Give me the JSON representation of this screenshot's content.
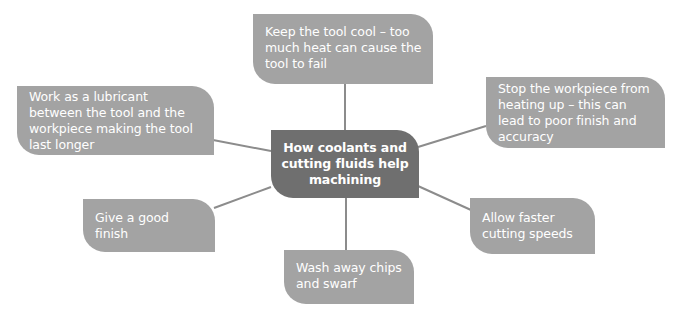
{
  "diagram": {
    "type": "mind-map",
    "center": {
      "label": "How coolants and cutting fluids help machining"
    },
    "nodes": [
      {
        "id": "top",
        "label": "Keep the tool cool – too much heat can cause the tool to fail"
      },
      {
        "id": "left",
        "label": "Work as a lubricant between the tool and the workpiece making the tool last longer"
      },
      {
        "id": "right",
        "label": "Stop the workpiece from heating up – this can lead to poor finish and accuracy"
      },
      {
        "id": "finish",
        "label": "Give a good finish"
      },
      {
        "id": "speed",
        "label": "Allow faster cutting speeds"
      },
      {
        "id": "wash",
        "label": "Wash away chips and swarf"
      }
    ],
    "edges": [
      {
        "from": "center",
        "to": "top"
      },
      {
        "from": "center",
        "to": "left"
      },
      {
        "from": "center",
        "to": "right"
      },
      {
        "from": "center",
        "to": "finish"
      },
      {
        "from": "center",
        "to": "speed"
      },
      {
        "from": "center",
        "to": "wash"
      }
    ],
    "colors": {
      "node_fill": "#a3a3a3",
      "center_fill": "#6f6f6f",
      "text": "#ffffff",
      "connector": "#8c8c8c"
    }
  }
}
